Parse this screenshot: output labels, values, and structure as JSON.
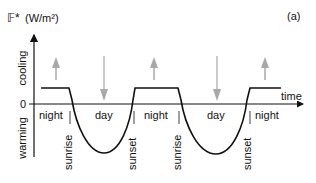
{
  "figure": {
    "panel_label": "(a)",
    "y_axis": {
      "symbol": "𝔽*",
      "unit": "(W/m²)",
      "upper_label": "cooling",
      "lower_label": "warming",
      "zero_label": "0"
    },
    "x_axis": {
      "label": "time"
    },
    "period_labels": [
      "night",
      "day",
      "night",
      "day",
      "night"
    ],
    "transition_labels": [
      "sunrise",
      "sunset",
      "sunrise",
      "sunset"
    ],
    "arrows": [
      {
        "direction": "up",
        "meaning": "cooling"
      },
      {
        "direction": "down",
        "meaning": "warming"
      },
      {
        "direction": "up",
        "meaning": "cooling"
      },
      {
        "direction": "down",
        "meaning": "warming"
      },
      {
        "direction": "up",
        "meaning": "cooling"
      }
    ],
    "colors": {
      "curve": "#111111",
      "arrows": "#a8a8a8",
      "axes": "#111111"
    }
  }
}
